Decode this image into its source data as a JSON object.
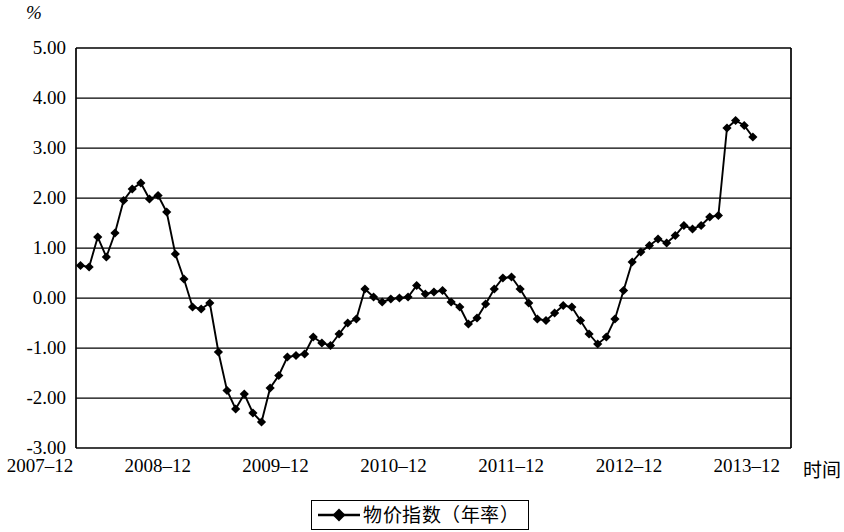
{
  "chart_data": {
    "type": "line",
    "title": "",
    "subtitle": "",
    "xlabel": "时间",
    "ylabel": "%",
    "unit_label": "%",
    "grid": true,
    "legend_position": "bottom",
    "legend": [
      "物价指数（年率）"
    ],
    "series": [
      {
        "name": "物价指数（年率）",
        "marker": "diamond",
        "color": "#000000",
        "values": [
          0.65,
          0.62,
          1.22,
          0.82,
          1.3,
          1.95,
          2.18,
          2.3,
          1.98,
          2.05,
          1.72,
          0.88,
          0.38,
          -0.18,
          -0.22,
          -0.1,
          -1.08,
          -1.85,
          -2.22,
          -1.92,
          -2.3,
          -2.48,
          -1.8,
          -1.55,
          -1.18,
          -1.15,
          -1.12,
          -0.78,
          -0.9,
          -0.95,
          -0.72,
          -0.5,
          -0.42,
          0.18,
          0.02,
          -0.08,
          -0.02,
          0.0,
          0.02,
          0.25,
          0.08,
          0.12,
          0.15,
          -0.08,
          -0.18,
          -0.52,
          -0.4,
          -0.12,
          0.18,
          0.4,
          0.42,
          0.18,
          -0.1,
          -0.42,
          -0.45,
          -0.3,
          -0.15,
          -0.18,
          -0.45,
          -0.72,
          -0.92,
          -0.78,
          -0.42,
          0.15,
          0.72,
          0.92,
          1.05,
          1.18,
          1.1,
          1.25,
          1.45,
          1.38,
          1.45,
          1.62,
          1.65,
          3.4,
          3.55,
          3.45,
          3.22
        ]
      }
    ],
    "x_ticks": [
      "2007–12",
      "2008–12",
      "2009–12",
      "2010–12",
      "2011–12",
      "2012–12",
      "2013–12"
    ],
    "y_ticks": [
      "5.00",
      "4.00",
      "3.00",
      "2.00",
      "1.00",
      "0.00",
      "-1.00",
      "-2.00",
      "-3.00"
    ],
    "ylim": [
      -3.0,
      5.0
    ],
    "y_major_step": 1.0,
    "x_start_label": "2007–12",
    "x_end_label": "2013–12",
    "axis_color": "#000000",
    "grid_color": "#000000",
    "background": "#ffffff"
  },
  "legend": {
    "label": "物价指数（年率）",
    "marker": "diamond-line-marker"
  },
  "axes": {
    "y_unit": "%",
    "x_title": "时间"
  }
}
